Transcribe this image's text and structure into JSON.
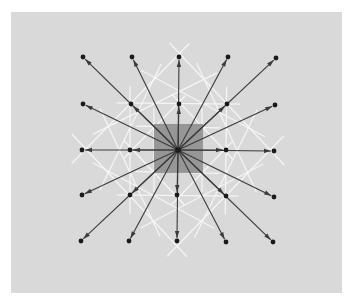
{
  "canvas": {
    "width": 356,
    "height": 299,
    "background": "#ffffff"
  },
  "panel": {
    "x": 11,
    "y": 12,
    "width": 331,
    "height": 281,
    "fill": "#d9d9d9"
  },
  "center_cell": {
    "x": 154,
    "y": 124,
    "width": 49,
    "height": 49,
    "fill": "#8a8a8a"
  },
  "center_point": {
    "x": 178,
    "y": 150
  },
  "colors": {
    "arrow": "#3a3a3a",
    "dot": "#1a1a1a",
    "bisector": "#f7f7f7"
  },
  "grid": {
    "columns_x": [
      82,
      130,
      178,
      226,
      275
    ],
    "rows_y": [
      57,
      104,
      150,
      196,
      242
    ]
  },
  "points": [
    {
      "x": 83,
      "y": 57
    },
    {
      "x": 132,
      "y": 57
    },
    {
      "x": 179,
      "y": 57
    },
    {
      "x": 228,
      "y": 57
    },
    {
      "x": 276,
      "y": 58
    },
    {
      "x": 83,
      "y": 104
    },
    {
      "x": 131,
      "y": 104
    },
    {
      "x": 179,
      "y": 104
    },
    {
      "x": 227,
      "y": 104
    },
    {
      "x": 275,
      "y": 105
    },
    {
      "x": 82,
      "y": 150
    },
    {
      "x": 130,
      "y": 150
    },
    {
      "x": 226,
      "y": 150
    },
    {
      "x": 274,
      "y": 151
    },
    {
      "x": 82,
      "y": 195
    },
    {
      "x": 130,
      "y": 195
    },
    {
      "x": 177,
      "y": 195
    },
    {
      "x": 226,
      "y": 196
    },
    {
      "x": 274,
      "y": 197
    },
    {
      "x": 81,
      "y": 241
    },
    {
      "x": 129,
      "y": 241
    },
    {
      "x": 177,
      "y": 241
    },
    {
      "x": 226,
      "y": 242
    },
    {
      "x": 273,
      "y": 242
    }
  ],
  "bisector_half_length": 60
}
